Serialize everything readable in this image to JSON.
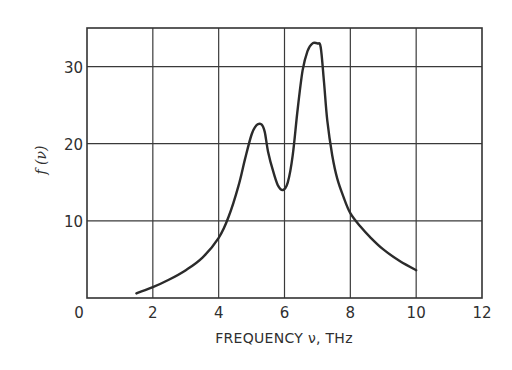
{
  "chart_data": {
    "type": "line",
    "title": "",
    "xlabel": "FREQUENCY ν, THz",
    "ylabel": "f (ν)",
    "xlim": [
      0,
      12
    ],
    "ylim": [
      0,
      35
    ],
    "grid": true,
    "legend": null,
    "x_ticks": [
      0,
      2,
      4,
      6,
      8,
      10,
      12
    ],
    "x_tick_labels": [
      "0",
      "2",
      "4",
      "6",
      "8",
      "10",
      "12"
    ],
    "y_ticks": [
      10,
      20,
      30
    ],
    "y_tick_labels": [
      "10",
      "20",
      "30"
    ],
    "series": [
      {
        "name": "f(ν)",
        "x": [
          1.5,
          2.0,
          2.5,
          3.0,
          3.5,
          4.0,
          4.3,
          4.6,
          4.8,
          5.0,
          5.15,
          5.3,
          5.4,
          5.5,
          5.65,
          5.8,
          5.95,
          6.1,
          6.25,
          6.4,
          6.55,
          6.7,
          6.85,
          7.0,
          7.1,
          7.2,
          7.3,
          7.45,
          7.6,
          7.8,
          8.0,
          8.3,
          8.6,
          9.0,
          9.5,
          10.0
        ],
        "values": [
          0.6,
          1.4,
          2.4,
          3.6,
          5.2,
          7.8,
          10.5,
          14.5,
          18.0,
          21.2,
          22.4,
          22.5,
          21.5,
          19.0,
          16.5,
          14.6,
          14.0,
          15.0,
          18.5,
          24.5,
          29.5,
          32.0,
          33.0,
          33.0,
          32.5,
          28.0,
          23.0,
          18.5,
          15.5,
          13.0,
          11.0,
          9.3,
          7.9,
          6.3,
          4.8,
          3.6
        ]
      }
    ],
    "annotations": []
  }
}
